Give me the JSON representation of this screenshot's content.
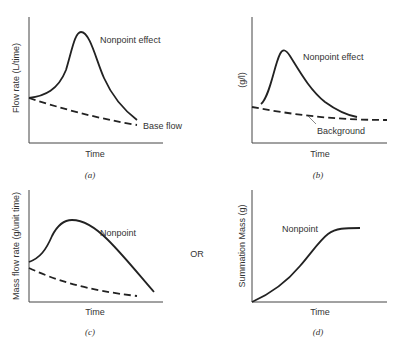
{
  "panels": {
    "a": {
      "ylabel": "Flow rate (L/time)",
      "xlabel": "Time",
      "caption": "(a)",
      "curve_label": "Nonpoint effect",
      "dashed_label": "Base flow"
    },
    "b": {
      "ylabel": "(g/l)",
      "xlabel": "Time",
      "caption": "(b)",
      "curve_label": "Nonpoint effect",
      "dashed_label": "Background"
    },
    "c": {
      "ylabel": "Mass flow rate (g/unit time)",
      "xlabel": "Time",
      "caption": "(c)",
      "curve_label": "Nonpoint"
    },
    "d": {
      "ylabel": "Summation Mass (g)",
      "xlabel": "Time",
      "caption": "(d)",
      "curve_label": "Nonpoint"
    }
  },
  "connector": "OR",
  "colors": {
    "line": "#222222",
    "axis": "#444444",
    "text": "#333333"
  }
}
